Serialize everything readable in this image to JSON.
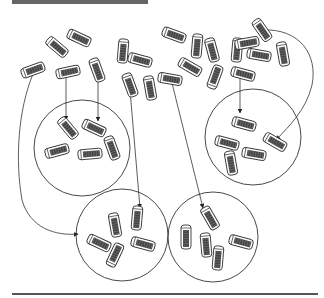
{
  "diagram": {
    "type": "sampling-illustration",
    "colors": {
      "stroke": "#333333",
      "capsule_fill": "#ffffff",
      "capsule_core": "#444444",
      "bar": "#666666",
      "rule": "#555555"
    },
    "population": {
      "capsules": [
        {
          "x": 33,
          "y": 70,
          "rot": -20
        },
        {
          "x": 57,
          "y": 47,
          "rot": 40
        },
        {
          "x": 79,
          "y": 38,
          "rot": 25
        },
        {
          "x": 68,
          "y": 72,
          "rot": -12
        },
        {
          "x": 97,
          "y": 70,
          "rot": 70
        },
        {
          "x": 123,
          "y": 51,
          "rot": 95
        },
        {
          "x": 140,
          "y": 60,
          "rot": 15
        },
        {
          "x": 130,
          "y": 85,
          "rot": 70
        },
        {
          "x": 150,
          "y": 88,
          "rot": 80
        },
        {
          "x": 170,
          "y": 79,
          "rot": 10
        },
        {
          "x": 174,
          "y": 35,
          "rot": 20
        },
        {
          "x": 197,
          "y": 46,
          "rot": 95
        },
        {
          "x": 212,
          "y": 50,
          "rot": 75
        },
        {
          "x": 190,
          "y": 67,
          "rot": 30
        },
        {
          "x": 215,
          "y": 77,
          "rot": -70
        },
        {
          "x": 237,
          "y": 50,
          "rot": 95
        },
        {
          "x": 243,
          "y": 74,
          "rot": 15
        },
        {
          "x": 259,
          "y": 55,
          "rot": 10
        },
        {
          "x": 262,
          "y": 30,
          "rot": 55
        },
        {
          "x": 283,
          "y": 54,
          "rot": 80
        },
        {
          "x": 247,
          "y": 43,
          "rot": -10
        }
      ]
    },
    "samples": [
      {
        "name": "sample-1",
        "cx": 82,
        "cy": 148,
        "r": 48,
        "capsules": [
          {
            "x": 68,
            "y": 128,
            "rot": 50
          },
          {
            "x": 94,
            "y": 128,
            "rot": 25
          },
          {
            "x": 57,
            "y": 151,
            "rot": -15
          },
          {
            "x": 90,
            "y": 154,
            "rot": -5
          },
          {
            "x": 112,
            "y": 148,
            "rot": 70
          }
        ]
      },
      {
        "name": "sample-2",
        "cx": 253,
        "cy": 137,
        "r": 48,
        "capsules": [
          {
            "x": 244,
            "y": 124,
            "rot": 15
          },
          {
            "x": 227,
            "y": 143,
            "rot": 15
          },
          {
            "x": 275,
            "y": 142,
            "rot": 30
          },
          {
            "x": 231,
            "y": 163,
            "rot": 80
          },
          {
            "x": 254,
            "y": 154,
            "rot": 10
          }
        ]
      },
      {
        "name": "sample-3",
        "cx": 122,
        "cy": 235,
        "r": 46,
        "capsules": [
          {
            "x": 115,
            "y": 225,
            "rot": 80
          },
          {
            "x": 137,
            "y": 218,
            "rot": 95
          },
          {
            "x": 99,
            "y": 243,
            "rot": 25
          },
          {
            "x": 115,
            "y": 255,
            "rot": -65
          },
          {
            "x": 143,
            "y": 244,
            "rot": 15
          }
        ]
      },
      {
        "name": "sample-4",
        "cx": 213,
        "cy": 237,
        "r": 45,
        "capsules": [
          {
            "x": 210,
            "y": 218,
            "rot": 60
          },
          {
            "x": 186,
            "y": 237,
            "rot": 90
          },
          {
            "x": 206,
            "y": 245,
            "rot": 85
          },
          {
            "x": 241,
            "y": 242,
            "rot": 15
          },
          {
            "x": 218,
            "y": 258,
            "rot": 95
          }
        ]
      }
    ],
    "arrows": [
      {
        "name": "arrow-to-sample-1-a",
        "d": "M66 76 L66 120"
      },
      {
        "name": "arrow-to-sample-1-b",
        "d": "M98 80 L98 121"
      },
      {
        "name": "arrow-to-sample-2-a",
        "d": "M240 78 L240 113"
      },
      {
        "name": "arrow-to-sample-2-b",
        "d": "M262 30 C300 28 318 55 312 85 C306 110 290 125 276 140"
      },
      {
        "name": "arrow-to-sample-3-a",
        "d": "M33 74 C18 110 15 160 22 200 C30 228 55 236 78 234"
      },
      {
        "name": "arrow-to-sample-3-b",
        "d": "M130 90 L140 208"
      },
      {
        "name": "arrow-to-sample-4",
        "d": "M172 83 L203 208"
      }
    ]
  }
}
